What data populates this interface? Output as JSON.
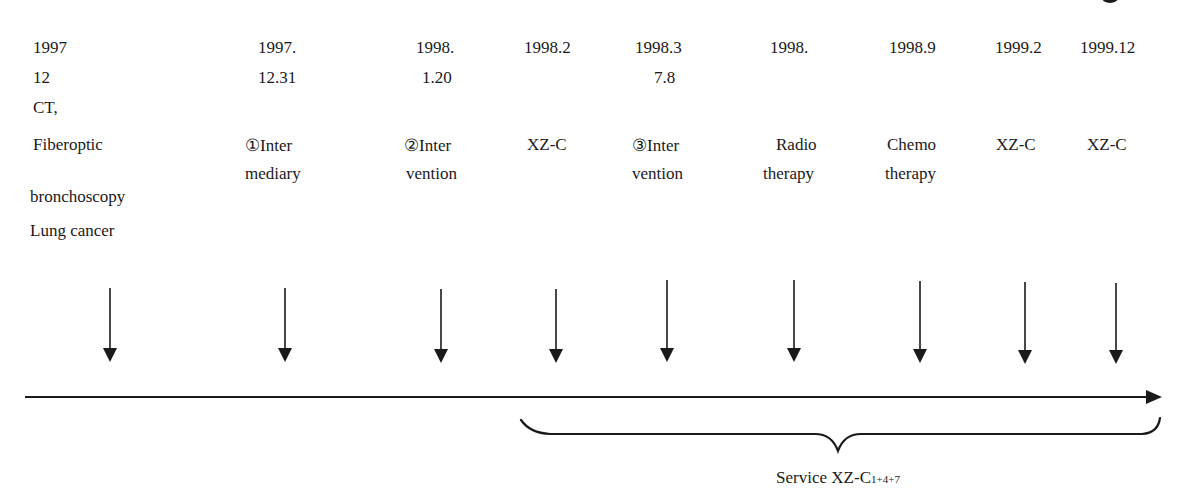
{
  "diagram": {
    "type": "timeline",
    "first_event": {
      "lines": [
        "1997",
        "12",
        "CT,",
        "Fiberoptic",
        "bronchoscopy",
        "Lung cancer"
      ]
    },
    "events": [
      {
        "date_line1": "1997.",
        "date_line2": "12.31",
        "label_line1": "①Inter",
        "label_line2": "mediary"
      },
      {
        "date_line1": "1998.",
        "date_line2": "1.20",
        "label_line1": "②Inter",
        "label_line2": "vention"
      },
      {
        "date_line1": "1998.2",
        "date_line2": "",
        "label_line1": "XZ-C",
        "label_line2": ""
      },
      {
        "date_line1": "1998.3",
        "date_line2": "7.8",
        "label_line1": "③Inter",
        "label_line2": "vention"
      },
      {
        "date_line1": "1998.",
        "date_line2": "",
        "label_line1": "Radio",
        "label_line2": "therapy"
      },
      {
        "date_line1": "1998.9",
        "date_line2": "",
        "label_line1": "Chemo",
        "label_line2": "therapy"
      },
      {
        "date_line1": "1999.2",
        "date_line2": "",
        "label_line1": "XZ-C",
        "label_line2": ""
      },
      {
        "date_line1": "1999.12",
        "date_line2": "",
        "label_line1": "XZ-C",
        "label_line2": ""
      }
    ],
    "brace_label": {
      "prefix": "Service XZ-C",
      "subscript": "1+4+7"
    },
    "colors": {
      "line": "#1a1a1a",
      "background": "#ffffff"
    }
  }
}
